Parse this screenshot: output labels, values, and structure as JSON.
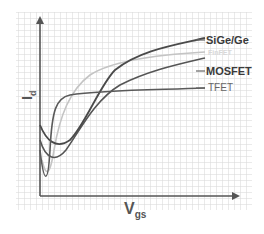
{
  "diagram": {
    "y_axis_label": "I",
    "y_axis_subscript": "d",
    "x_axis_label": "V",
    "x_axis_subscript": "gs",
    "curves": [
      {
        "name": "SiGe/Ge",
        "color": "#4a4a4a"
      },
      {
        "name": "FinFET",
        "color": "#c4c4c4"
      },
      {
        "name": "MOSFET",
        "color": "#555555"
      },
      {
        "name": "TFET",
        "color": "#5a5a5a"
      }
    ],
    "grid_color": "#d6d6d6",
    "axis_color": "#555555"
  }
}
